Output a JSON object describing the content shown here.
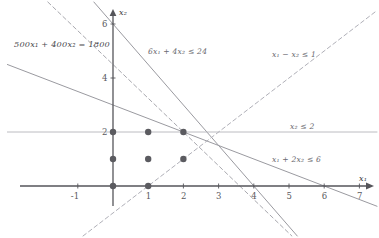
{
  "chart_data": {
    "type": "line",
    "title": "",
    "xlabel": "x1",
    "ylabel": "x2",
    "xlim": [
      -1.6,
      7.6
    ],
    "ylim": [
      -1.2,
      7.2
    ],
    "grid": false,
    "legend_position": "inline-annotations",
    "axis_names": {
      "x": "x₁",
      "y": "x₂"
    },
    "x_ticks": [
      -1,
      1,
      2,
      3,
      4,
      5,
      6,
      7
    ],
    "x_tick_labels": [
      "-1",
      "1",
      "2",
      "3",
      "4",
      "5",
      "6",
      "7"
    ],
    "y_ticks": [
      2,
      4,
      6
    ],
    "y_tick_labels": [
      "2",
      "4",
      "6"
    ],
    "lines": [
      {
        "name": "constraint-6x1-4x2",
        "label": "6x₁ + 4x₂ ≤ 24",
        "equation": "6x1 + 4x2 = 24",
        "style": "solid",
        "color": "#9a9aa0",
        "x_intercept": 4,
        "y_intercept": 6,
        "slope": -1.5,
        "label_x": 2.0,
        "label_y": 5.15
      },
      {
        "name": "objective-500x1-400x2",
        "label": "500x₁ + 400x₂ = 1800",
        "equation": "500x1 + 400x2 = 1800",
        "style": "dashed",
        "color": "#a8a8ae",
        "x_intercept": 3.6,
        "y_intercept": 4.5,
        "slope": -1.25,
        "label_x": -1.35,
        "label_y": 5.55
      },
      {
        "name": "constraint-x1-2x2",
        "label": "x₁ + 2x₂ ≤ 6",
        "equation": "x1 + 2x2 = 6",
        "style": "solid",
        "color": "#9a9aa0",
        "x_intercept": 6,
        "y_intercept": 3,
        "slope": -0.5,
        "label_x": 4.6,
        "label_y": 1.45
      },
      {
        "name": "constraint-x2-le-2",
        "label": "x₂ ≤ 2",
        "equation": "x2 = 2",
        "style": "solid",
        "color": "#b4b4ba",
        "slope": 0,
        "y_intercept": 2,
        "label_x": 5.2,
        "label_y": 2.45
      },
      {
        "name": "constraint-x1-minus-x2",
        "label": "x₁ − x₂ ≤ 1",
        "equation": "x1 - x2 = 1",
        "style": "dashed",
        "color": "#b0b0b8",
        "slope": 1,
        "x_intercept": 1,
        "label_x": 4.5,
        "label_y": 5.3
      }
    ],
    "points": [
      {
        "x": 0,
        "y": 0
      },
      {
        "x": 1,
        "y": 0
      },
      {
        "x": 0,
        "y": 1
      },
      {
        "x": 1,
        "y": 1
      },
      {
        "x": 2,
        "y": 1
      },
      {
        "x": 0,
        "y": 2
      },
      {
        "x": 1,
        "y": 2
      },
      {
        "x": 2,
        "y": 2
      }
    ],
    "point_color": "#5b5b60",
    "axis_color": "#55555a"
  },
  "annotations": {
    "objective": "500x₁ + 400x₂ = 1800",
    "c1": "6x₁ + 4x₂ ≤ 24",
    "c2": "x₁ − x₂ ≤ 1",
    "c3": "x₂ ≤ 2",
    "c4": "x₁ + 2x₂ ≤ 6",
    "axis_x": "x₁",
    "axis_y": "x₂"
  },
  "ticks": {
    "x": [
      "-1",
      "1",
      "2",
      "3",
      "4",
      "5",
      "6",
      "7"
    ],
    "y": [
      "2",
      "4",
      "6"
    ]
  }
}
